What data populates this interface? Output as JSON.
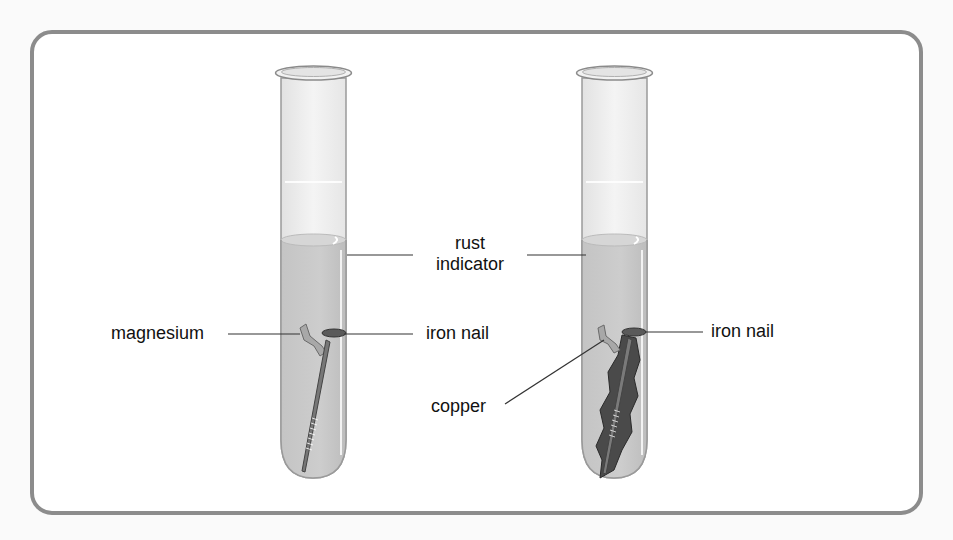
{
  "diagram": {
    "title": "",
    "tubes": [
      {
        "id": "tube-left",
        "contents": [
          "magnesium",
          "iron nail",
          "rust indicator"
        ],
        "colors": {
          "liquid": "#c8c8c8",
          "glass": "#ebebeb",
          "nail": "#777777",
          "metal_strip": "#a8a8a8"
        }
      },
      {
        "id": "tube-right",
        "contents": [
          "copper",
          "iron nail",
          "rust indicator"
        ],
        "colors": {
          "liquid": "#c8c8c8",
          "glass": "#ebebeb",
          "nail": "#777777",
          "copper": "#4a4a4a",
          "metal_strip": "#a8a8a8"
        }
      }
    ],
    "labels": {
      "magnesium": "magnesium",
      "rust": "rust",
      "indicator": "indicator",
      "iron_nail_left": "iron nail",
      "iron_nail_right": "iron nail",
      "copper": "copper"
    },
    "colors": {
      "frame": "#8c8c8c",
      "leader_line": "#333333",
      "text": "#111111"
    }
  }
}
